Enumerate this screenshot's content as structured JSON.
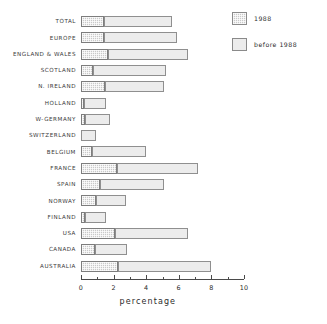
{
  "chart_data": {
    "type": "bar",
    "orientation": "horizontal",
    "stacked": true,
    "title": "",
    "xlabel": "percentage",
    "ylabel": "",
    "xlim": [
      0,
      10
    ],
    "xticks": [
      0,
      2,
      4,
      6,
      8,
      10
    ],
    "xtick_labels": [
      "0",
      "2",
      "4",
      "6",
      "8",
      "10"
    ],
    "minor_ticks": [
      1,
      3,
      5,
      7,
      9
    ],
    "grid": false,
    "legend_position": "top-right",
    "categories": [
      "TOTAL",
      "EUROPE",
      "ENGLAND & WALES",
      "SCOTLAND",
      "N. IRELAND",
      "HOLLAND",
      "W-GERMANY",
      "SWITZERLAND",
      "BELGIUM",
      "FRANCE",
      "SPAIN",
      "NORWAY",
      "FINLAND",
      "USA",
      "CANADA",
      "AUSTRALIA"
    ],
    "series": [
      {
        "name": "1988",
        "values": [
          1.4,
          1.4,
          1.65,
          0.75,
          1.45,
          0.2,
          0.25,
          0.0,
          0.65,
          2.2,
          1.15,
          0.95,
          0.25,
          2.1,
          0.85,
          2.3
        ]
      },
      {
        "name": "before 1988",
        "values": [
          4.2,
          4.5,
          4.9,
          4.45,
          3.65,
          1.35,
          1.5,
          0.9,
          3.35,
          5.0,
          3.95,
          1.8,
          1.3,
          4.45,
          2.0,
          5.7
        ]
      }
    ],
    "totals": [
      5.6,
      5.9,
      6.55,
      5.2,
      5.1,
      1.55,
      1.75,
      0.9,
      4.0,
      7.2,
      5.1,
      2.75,
      1.55,
      6.55,
      2.85,
      8.0
    ]
  },
  "legend": {
    "items": [
      {
        "label": "1988",
        "swatch": "hatched"
      },
      {
        "label": "before 1988",
        "swatch": "light"
      }
    ]
  },
  "axis": {
    "title": "percentage"
  },
  "colors": {
    "recent_fill": "#c9c9c9",
    "before_fill": "#ececec",
    "outline": "#8a8a8a",
    "text": "#2b2b2b",
    "background": "#ffffff"
  }
}
